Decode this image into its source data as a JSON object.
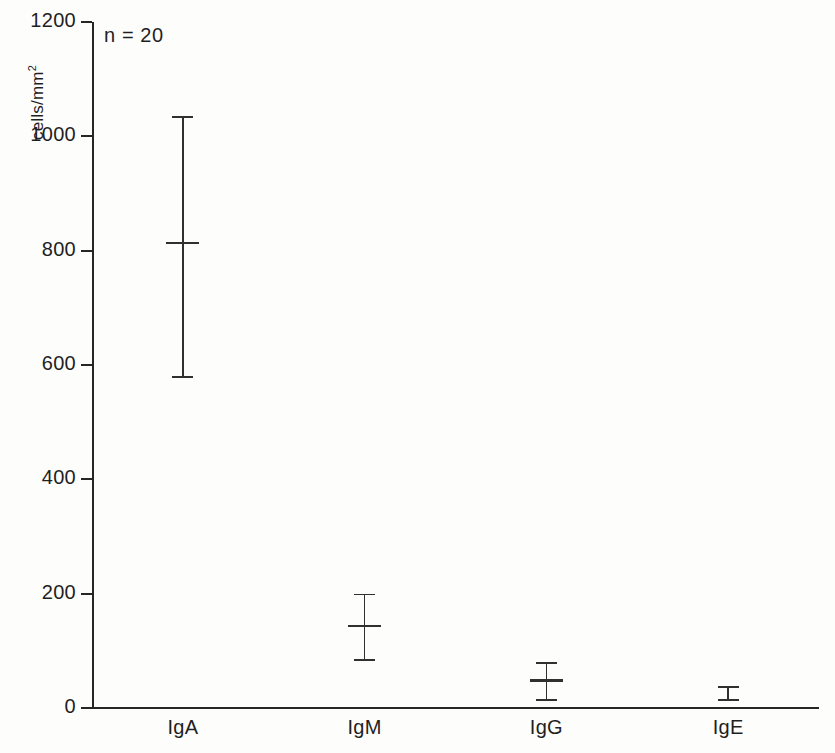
{
  "chart_data": {
    "type": "errorbar",
    "title": "",
    "xlabel": "",
    "ylabel": "cells/mm",
    "ylabel_sup": "2",
    "annotation": "n = 20",
    "sample_size": 20,
    "categories": [
      "IgA",
      "IgM",
      "IgG",
      "IgE"
    ],
    "values": [
      815,
      145,
      50,
      22
    ],
    "err_low": [
      580,
      85,
      15,
      15
    ],
    "err_high": [
      1035,
      200,
      80,
      38
    ],
    "series": [
      {
        "name": "Immunoglobulin-containing cells",
        "points": [
          {
            "category": "IgA",
            "mean": 815,
            "low": 580,
            "high": 1035
          },
          {
            "category": "IgM",
            "mean": 145,
            "low": 85,
            "high": 200
          },
          {
            "category": "IgG",
            "mean": 50,
            "low": 15,
            "high": 80
          },
          {
            "category": "IgE",
            "mean": 22,
            "low": 15,
            "high": 38
          }
        ]
      }
    ],
    "ylim": [
      0,
      1200
    ],
    "yticks": [
      0,
      200,
      400,
      600,
      800,
      1000,
      1200
    ],
    "ytick_labels": [
      "0",
      "200",
      "400",
      "600",
      "800",
      "1000",
      "1200"
    ],
    "grid": false,
    "legend": false,
    "legend_position": "none",
    "axis_color": "#262626",
    "marker_color": "#303030",
    "background_color": "#fdfdfc"
  }
}
